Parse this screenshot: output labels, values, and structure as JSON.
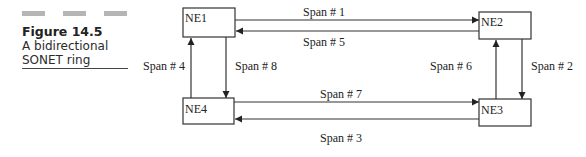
{
  "caption": {
    "figure_label": "Figure 14.5",
    "lines": [
      "A bidirectional",
      "SONET ring"
    ]
  },
  "diagram": {
    "nodes": [
      {
        "id": "NE1",
        "label": "NE1"
      },
      {
        "id": "NE2",
        "label": "NE2"
      },
      {
        "id": "NE3",
        "label": "NE3"
      },
      {
        "id": "NE4",
        "label": "NE4"
      }
    ],
    "spans": [
      {
        "id": "span-1",
        "label": "Span # 1",
        "from": "NE1",
        "to": "NE2"
      },
      {
        "id": "span-2",
        "label": "Span # 2",
        "from": "NE2",
        "to": "NE3"
      },
      {
        "id": "span-3",
        "label": "Span # 3",
        "from": "NE3",
        "to": "NE4"
      },
      {
        "id": "span-4",
        "label": "Span # 4",
        "from": "NE4",
        "to": "NE1"
      },
      {
        "id": "span-5",
        "label": "Span # 5",
        "from": "NE2",
        "to": "NE1"
      },
      {
        "id": "span-6",
        "label": "Span # 6",
        "from": "NE3",
        "to": "NE2"
      },
      {
        "id": "span-7",
        "label": "Span # 7",
        "from": "NE4",
        "to": "NE3"
      },
      {
        "id": "span-8",
        "label": "Span # 8",
        "from": "NE1",
        "to": "NE4"
      }
    ]
  }
}
